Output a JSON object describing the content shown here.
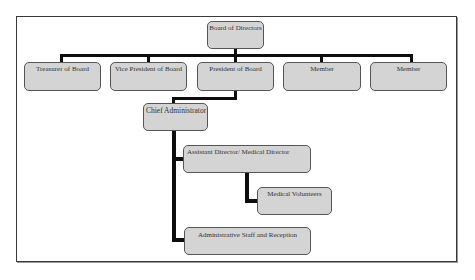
{
  "diagram": {
    "type": "org-chart",
    "root": {
      "label": "Board of Directors"
    },
    "board_row": [
      {
        "label": "Treasurer of Board"
      },
      {
        "label": "Vice President of Board"
      },
      {
        "label": "President of Board"
      },
      {
        "label": "Member"
      },
      {
        "label": "Member"
      }
    ],
    "chief": {
      "label": "Chief Administrator"
    },
    "assistant": {
      "label": "Assistant Director/ Medical Director"
    },
    "volunteers": {
      "label": "Medical Volunteers"
    },
    "admin_staff": {
      "label": "Administrative Staff and Reception"
    },
    "edges": [
      [
        "Board of Directors",
        "Treasurer of Board"
      ],
      [
        "Board of Directors",
        "Vice President of Board"
      ],
      [
        "Board of Directors",
        "President of Board"
      ],
      [
        "Board of Directors",
        "Member"
      ],
      [
        "Board of Directors",
        "Member"
      ],
      [
        "President of Board",
        "Chief Administrator"
      ],
      [
        "Chief Administrator",
        "Assistant Director/ Medical Director"
      ],
      [
        "Chief Administrator",
        "Administrative Staff and Reception"
      ],
      [
        "Assistant Director/ Medical Director",
        "Medical Volunteers"
      ]
    ],
    "colors": {
      "node_fill": "#d4d4d4",
      "node_border": "#555555",
      "connector": "#0d0d0d",
      "frame": "#3a3a3a"
    }
  }
}
